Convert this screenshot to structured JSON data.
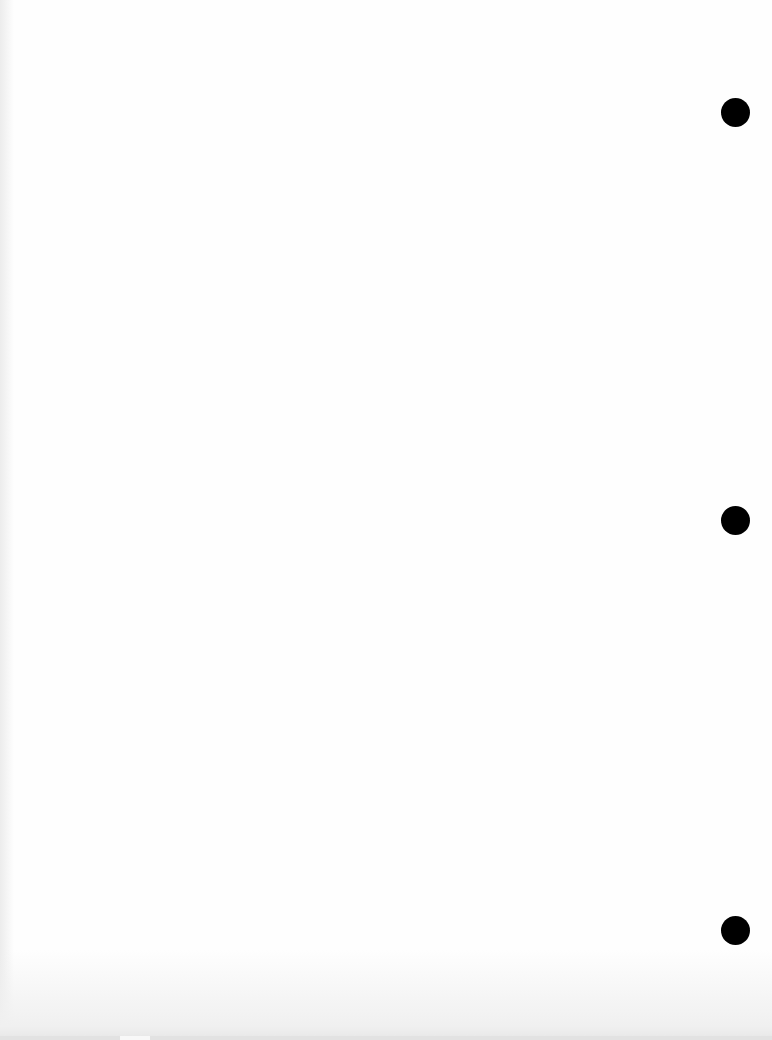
{
  "document": {
    "type": "blank hole-punched sheet",
    "text_content": "",
    "background_color": "#fefefe"
  },
  "punch_holes": [
    {
      "icon": "punch-hole-icon",
      "center_x": 735,
      "center_y": 112,
      "diameter": 29,
      "color": "#000000"
    },
    {
      "icon": "punch-hole-icon",
      "center_x": 735,
      "center_y": 520,
      "diameter": 29,
      "color": "#000000"
    },
    {
      "icon": "punch-hole-icon",
      "center_x": 735,
      "center_y": 930,
      "diameter": 29,
      "color": "#000000"
    }
  ]
}
